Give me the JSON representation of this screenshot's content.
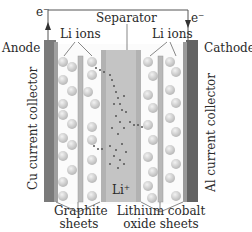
{
  "diagram": {
    "labels": {
      "electron_left": "e⁻",
      "electron_right": "e⁻",
      "separator": "Separator",
      "li_ions_left": "Li ions",
      "li_ions_right": "Li ions",
      "anode": "Anode",
      "cathode": "Cathode",
      "cu_collector": "Cu current collector",
      "al_collector": "Al current collector",
      "li_plus": "Li⁺",
      "graphite_line1": "Graphite",
      "graphite_line2": "sheets",
      "licoo2_line1": "Lithium cobalt",
      "licoo2_line2": "oxide sheets"
    },
    "colors": {
      "collector_cu": "#7a7a7a",
      "collector_al": "#666666",
      "sheet": "#b5b5b5",
      "separator": "#b0b0b0",
      "ion": "#cfcfcf",
      "wire": "#555555",
      "dots": "#555555"
    }
  }
}
